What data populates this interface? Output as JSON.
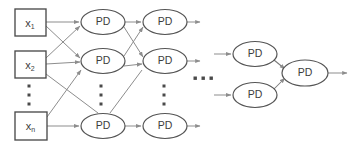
{
  "diagram": {
    "background_color": "#ffffff",
    "node_stroke_color": "#555555",
    "box_stroke_color": "#4a4a4a",
    "edge_color": "#8d8d8d",
    "text_color": "#3d3d3d",
    "inputs": [
      {
        "id": "x1",
        "label": "x",
        "subscript": "1",
        "x": 15,
        "y": 9,
        "w": 31,
        "h": 27
      },
      {
        "id": "x2",
        "label": "x",
        "subscript": "2",
        "x": 15,
        "y": 51,
        "w": 31,
        "h": 27
      },
      {
        "id": "xn",
        "label": "x",
        "subscript": "n",
        "x": 15,
        "y": 112,
        "w": 32,
        "h": 28
      }
    ],
    "input_vertical_ellipsis": {
      "x": 29,
      "ys": [
        86,
        95,
        104
      ]
    },
    "layers": [
      {
        "id": "layer-1",
        "cx": 103,
        "nodes": [
          {
            "id": "l1-n1",
            "label": "PD",
            "cx": 103,
            "cy": 22,
            "rx": 22,
            "ry": 12.5
          },
          {
            "id": "l1-n2",
            "label": "PD",
            "cx": 103,
            "cy": 61,
            "rx": 22,
            "ry": 12.5
          },
          {
            "id": "l1-n3",
            "label": "PD",
            "cx": 103,
            "cy": 126,
            "rx": 22,
            "ry": 12.5
          }
        ],
        "vertical_ellipsis": {
          "x": 101,
          "ys": [
            86,
            95,
            104
          ]
        }
      },
      {
        "id": "layer-2",
        "cx": 165,
        "nodes": [
          {
            "id": "l2-n1",
            "label": "PD",
            "cx": 165,
            "cy": 22,
            "rx": 22,
            "ry": 12.5
          },
          {
            "id": "l2-n2",
            "label": "PD",
            "cx": 165,
            "cy": 61,
            "rx": 22,
            "ry": 12.5
          },
          {
            "id": "l2-n3",
            "label": "PD",
            "cx": 165,
            "cy": 126,
            "rx": 22,
            "ry": 12.5
          }
        ],
        "vertical_ellipsis": {
          "x": 164,
          "ys": [
            86,
            95,
            104
          ]
        }
      },
      {
        "id": "layer-3",
        "cx": 255,
        "nodes": [
          {
            "id": "l3-n1",
            "label": "PD",
            "cx": 255,
            "cy": 54,
            "rx": 22,
            "ry": 12.5
          },
          {
            "id": "l3-n2",
            "label": "PD",
            "cx": 255,
            "cy": 95,
            "rx": 22,
            "ry": 12.5
          }
        ]
      },
      {
        "id": "layer-output",
        "cx": 305,
        "nodes": [
          {
            "id": "out-n1",
            "label": "PD",
            "cx": 305,
            "cy": 73,
            "rx": 23,
            "ry": 13
          }
        ]
      }
    ],
    "horizontal_ellipsis": {
      "xs": [
        195,
        203,
        211
      ],
      "y": 78
    },
    "output_arrow": {
      "from_x": 328,
      "to_x": 347,
      "y": 73
    }
  }
}
